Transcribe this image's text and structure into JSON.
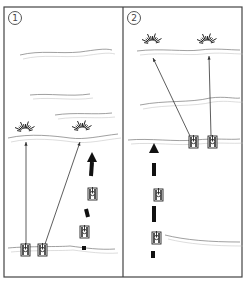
{
  "frame": {
    "x": 4,
    "y": 7,
    "w": 238,
    "h": 270,
    "divider_x": 123,
    "stroke": "#444444"
  },
  "panels": [
    {
      "id": "panel-1",
      "label": "1",
      "label_pos": {
        "x": 8,
        "y": 11
      },
      "ridges": [
        "M20,55 C40,50 60,54 80,52 C95,50 105,48 112,50",
        "M30,95 C50,93 70,97 90,94",
        "M55,115 C75,112 95,115 112,113",
        "M8,138 C30,133 55,136 70,138 C85,140 100,136 118,134",
        "M8,248 C30,246 60,247 70,246 C85,248 100,250 115,249"
      ],
      "explosions": [
        {
          "x": 25,
          "y": 132
        },
        {
          "x": 82,
          "y": 131
        }
      ],
      "fire_lines": [
        {
          "x1": 26,
          "y1": 247,
          "x2": 26,
          "y2": 142
        },
        {
          "x1": 44,
          "y1": 247,
          "x2": 80,
          "y2": 142
        }
      ],
      "tanks": [
        {
          "x": 21,
          "y": 244
        },
        {
          "x": 38,
          "y": 244
        },
        {
          "x": 88,
          "y": 188
        },
        {
          "x": 80,
          "y": 226
        }
      ],
      "move_arrow": {
        "segments": [
          [
            [
              84,
              250
            ],
            [
              84,
              246
            ]
          ],
          [
            [
              88,
              217
            ],
            [
              86,
              209
            ]
          ],
          [
            [
              91,
              176
            ],
            [
              92,
              162
            ]
          ]
        ],
        "head": {
          "x": 92,
          "y": 152
        }
      }
    },
    {
      "id": "panel-2",
      "label": "2",
      "label_pos": {
        "x": 127,
        "y": 11
      },
      "ridges": [
        "M137,51 C160,48 185,52 200,50 C215,48 230,50 240,50",
        "M140,105 C165,100 190,103 210,98 C225,96 235,99 240,98",
        "M128,140 C150,138 175,142 195,140 C215,138 230,140 240,139",
        "M165,235 C185,240 210,242 240,242"
      ],
      "explosions": [
        {
          "x": 152,
          "y": 44
        },
        {
          "x": 207,
          "y": 44
        }
      ],
      "fire_lines": [
        {
          "x1": 190,
          "y1": 136,
          "x2": 153,
          "y2": 58
        },
        {
          "x1": 211,
          "y1": 136,
          "x2": 209,
          "y2": 56
        }
      ],
      "tanks": [
        {
          "x": 189,
          "y": 136
        },
        {
          "x": 208,
          "y": 136
        },
        {
          "x": 154,
          "y": 189
        },
        {
          "x": 152,
          "y": 232
        }
      ],
      "move_arrow": {
        "segments": [
          [
            [
              153,
              251
            ],
            [
              153,
              258
            ]
          ],
          [
            [
              154,
              206
            ],
            [
              154,
              222
            ]
          ],
          [
            [
              154,
              163
            ],
            [
              154,
              176
            ]
          ]
        ],
        "head": {
          "x": 154,
          "y": 143
        }
      }
    }
  ]
}
